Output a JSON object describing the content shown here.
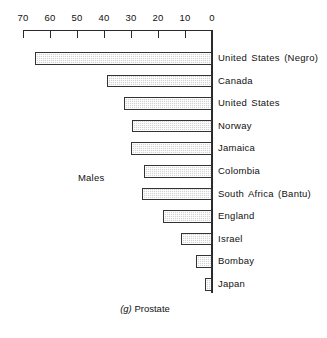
{
  "chart_data": {
    "type": "bar",
    "orientation": "horizontal",
    "title": "(g) Prostate",
    "caption_index": "(g)",
    "caption_text": "Prostate",
    "group_label": "Males",
    "xlabel": "",
    "ylabel": "",
    "xlim": [
      70,
      0
    ],
    "axis_reversed": true,
    "grid": false,
    "legend": "none",
    "tick_labels": [
      "70",
      "60",
      "50",
      "40",
      "30",
      "20",
      "10",
      "0"
    ],
    "tick_values": [
      70,
      60,
      50,
      40,
      30,
      20,
      10,
      0
    ],
    "categories": [
      "United States (Negro)",
      "Canada",
      "United States",
      "Norway",
      "Jamaica",
      "Colombia",
      "South Africa (Bantu)",
      "England",
      "Israel",
      "Bombay",
      "Japan"
    ],
    "values": [
      65.5,
      39.0,
      32.5,
      29.5,
      30.0,
      25.0,
      26.0,
      18.0,
      11.5,
      6.0,
      2.5
    ],
    "bar_fill_color": "#d4d4d4",
    "bar_border_color": "#333333",
    "axis_color": "#2a2a2a"
  }
}
